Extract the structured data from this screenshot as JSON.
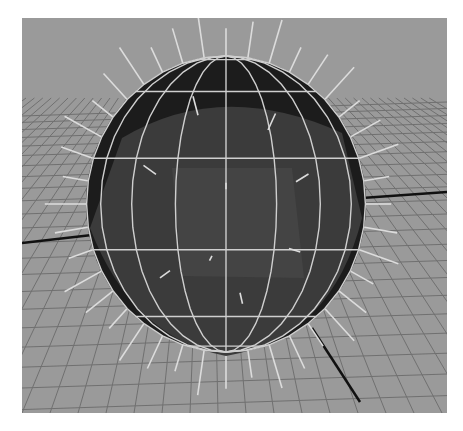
{
  "viewport": {
    "label": "3D viewport - polygon sphere with vertex normals displayed",
    "background": "#9a9a9a",
    "grid_color": "#6e6e6e",
    "axis_color": "#111111",
    "sphere_fill_light": "#3a3a3a",
    "sphere_fill_dark": "#151515",
    "wire_color": "#cfcfcf",
    "normal_color": "#d8d8d8"
  },
  "scene": {
    "object": "polySphere",
    "display": [
      "shaded",
      "wireframe-on-shaded",
      "normals"
    ],
    "center": [
      204,
      186
    ],
    "rx": 140,
    "ry": 148
  }
}
